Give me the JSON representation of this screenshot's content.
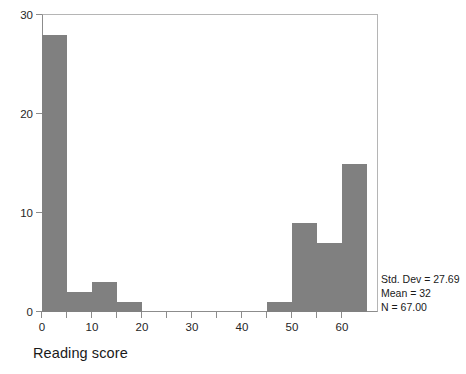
{
  "chart_data": {
    "type": "bar",
    "chart_kind": "histogram",
    "title": "",
    "xlabel": "Reading score",
    "ylabel": "",
    "bin_width": 5,
    "xlim": [
      -3.6,
      63.6
    ],
    "ylim": [
      0,
      30.1
    ],
    "grid": false,
    "legend": null,
    "bar_color": "#808080",
    "axis_color": "#8c8c8c",
    "x_ticks": [
      0,
      10,
      20,
      30,
      40,
      50,
      60
    ],
    "x_minor_ticks": [
      5,
      15,
      25,
      35,
      45,
      55
    ],
    "y_ticks": [
      0,
      10,
      20,
      30
    ],
    "bin_centers": [
      -2.5,
      2.5,
      7.5,
      12.5,
      17.5,
      22.5,
      27.5,
      32.5,
      37.5,
      42.5,
      47.5,
      52.5,
      57.5,
      62.5
    ],
    "bin_starts": [
      -5,
      0,
      5,
      10,
      15,
      20,
      25,
      30,
      35,
      40,
      45,
      50,
      55,
      60
    ],
    "values": [
      1,
      28,
      2,
      3,
      1,
      0,
      0,
      0,
      0,
      0,
      1,
      9,
      7,
      15
    ],
    "categories": [
      "-5 to 0",
      "0 to 5",
      "5 to 10",
      "10 to 15",
      "15 to 20",
      "20 to 25",
      "25 to 30",
      "30 to 35",
      "35 to 40",
      "40 to 45",
      "45 to 50",
      "50 to 55",
      "55 to 60",
      "60 to 65"
    ],
    "annotations": {
      "std_dev": "Std. Dev = 27.69",
      "mean": "Mean = 32",
      "n": "N = 67.00"
    }
  },
  "axes": {
    "x_tick_labels": [
      "0",
      "10",
      "20",
      "30",
      "40",
      "50",
      "60"
    ],
    "y_tick_labels": [
      "0",
      "10",
      "20",
      "30"
    ],
    "x_title": "Reading score"
  },
  "stats": {
    "line1": "Std. Dev = 27.69",
    "line2": "Mean = 32",
    "line3": "N = 67.00"
  }
}
